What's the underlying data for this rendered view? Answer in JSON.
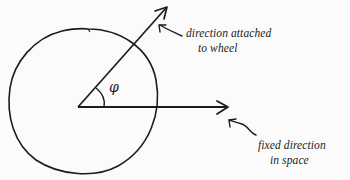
{
  "diagram": {
    "type": "rotating-wheel-angle",
    "wheel": {
      "shape": "circle",
      "center": [
        80,
        107
      ],
      "radius": 74
    },
    "vectors": [
      {
        "id": "attached",
        "from": [
          78,
          107
        ],
        "to": [
          167,
          7
        ],
        "label_lines": [
          "direction attached",
          "to wheel"
        ]
      },
      {
        "id": "fixed",
        "from": [
          78,
          107
        ],
        "to": [
          228,
          107
        ],
        "label_lines": [
          "fixed direction",
          "in space"
        ]
      }
    ],
    "angle": {
      "symbol": "φ",
      "between": [
        "fixed",
        "attached"
      ]
    },
    "stroke_color": "#1c1c1c",
    "background_color": "#fbfbfb"
  },
  "labels": {
    "attached_line1": "direction attached",
    "attached_line2": "to wheel",
    "fixed_line1": "fixed direction",
    "fixed_line2": "in space",
    "angle_symbol": "φ"
  }
}
